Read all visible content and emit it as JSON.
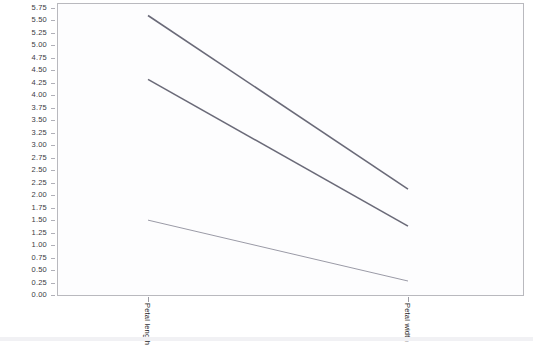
{
  "chart_data": {
    "type": "line",
    "title": "",
    "subtitle": "",
    "xlabel": "",
    "ylabel": "",
    "categories": [
      "Petal length",
      "Petal width"
    ],
    "x_tick_labels": [
      "Petal length",
      "Petal width"
    ],
    "y_tick_labels": [
      "5.75",
      "5.50",
      "5.25",
      "5.00",
      "4.75",
      "4.50",
      "4.25",
      "4.00",
      "3.75",
      "3.50",
      "3.25",
      "3.00",
      "2.75",
      "2.50",
      "2.25",
      "2.00",
      "1.75",
      "1.50",
      "1.25",
      "1.00",
      "0.75",
      "0.50",
      "0.25",
      "0.00"
    ],
    "ylim": [
      0.0,
      5.85
    ],
    "y_tick_step": 0.25,
    "xlim_categories": 2,
    "grid": false,
    "legend": "none",
    "series": [
      {
        "name": "Series 1",
        "values": [
          5.6,
          2.12
        ],
        "color": "#6a6a78"
      },
      {
        "name": "Series 2",
        "values": [
          4.32,
          1.38
        ],
        "color": "#6a6a78"
      },
      {
        "name": "Series 3",
        "values": [
          1.5,
          0.28
        ],
        "color": "#9a9aa6"
      }
    ],
    "line_color_primary": "#6a6a78",
    "line_color_light": "#9a9aa6",
    "frame_color": "#b9b9be",
    "plot_background": "#fdfdfe",
    "page_background": "#ffffff",
    "tick_text_color": "#3b3b44"
  },
  "axis": {
    "y_ticks": [
      {
        "label": "5.75",
        "value": 5.75
      },
      {
        "label": "5.50",
        "value": 5.5
      },
      {
        "label": "5.25",
        "value": 5.25
      },
      {
        "label": "5.00",
        "value": 5.0
      },
      {
        "label": "4.75",
        "value": 4.75
      },
      {
        "label": "4.50",
        "value": 4.5
      },
      {
        "label": "4.25",
        "value": 4.25
      },
      {
        "label": "4.00",
        "value": 4.0
      },
      {
        "label": "3.75",
        "value": 3.75
      },
      {
        "label": "3.50",
        "value": 3.5
      },
      {
        "label": "3.25",
        "value": 3.25
      },
      {
        "label": "3.00",
        "value": 3.0
      },
      {
        "label": "2.75",
        "value": 2.75
      },
      {
        "label": "2.50",
        "value": 2.5
      },
      {
        "label": "2.25",
        "value": 2.25
      },
      {
        "label": "2.00",
        "value": 2.0
      },
      {
        "label": "1.75",
        "value": 1.75
      },
      {
        "label": "1.50",
        "value": 1.5
      },
      {
        "label": "1.25",
        "value": 1.25
      },
      {
        "label": "1.00",
        "value": 1.0
      },
      {
        "label": "0.75",
        "value": 0.75
      },
      {
        "label": "0.50",
        "value": 0.5
      },
      {
        "label": "0.25",
        "value": 0.25
      },
      {
        "label": "0.00",
        "value": 0.0
      }
    ],
    "x_ticks": [
      {
        "label": "Petal length",
        "px": 148
      },
      {
        "label": "Petal width",
        "px": 408
      }
    ]
  }
}
